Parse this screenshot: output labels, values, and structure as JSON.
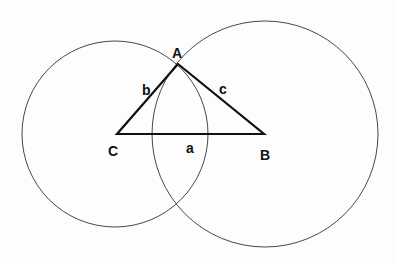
{
  "diagram": {
    "type": "triangle-with-circles",
    "vertices": {
      "A": {
        "label": "A",
        "x": 178,
        "y": 64
      },
      "B": {
        "label": "B",
        "x": 264,
        "y": 134
      },
      "C": {
        "label": "C",
        "x": 117,
        "y": 134
      }
    },
    "sides": {
      "a": {
        "label": "a"
      },
      "b": {
        "label": "b"
      },
      "c": {
        "label": "c"
      }
    },
    "circles": [
      {
        "name": "circle-centered-C",
        "cx": 115,
        "cy": 134,
        "r": 93
      },
      {
        "name": "circle-centered-B",
        "cx": 265,
        "cy": 134,
        "r": 113
      }
    ],
    "colors": {
      "stroke": "#222222",
      "background": "#fdfdfd"
    }
  }
}
